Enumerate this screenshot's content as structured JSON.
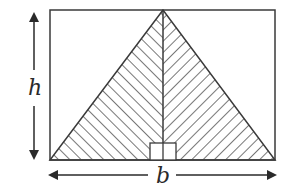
{
  "diagram": {
    "labels": {
      "height": "h",
      "base": "b"
    },
    "colors": {
      "stroke": "#3a3a3a",
      "hatch": "#555555",
      "background": "#ffffff"
    },
    "shapes": {
      "rectangle": "outer-rectangle",
      "triangle": "hatched-triangle",
      "altitude": "vertical-altitude-line",
      "right_angle_marker": "right-angle-square"
    }
  }
}
